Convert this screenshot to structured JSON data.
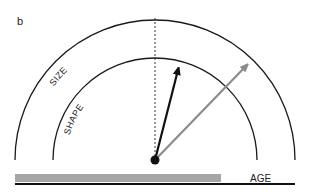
{
  "panel_label": "b",
  "arcs": {
    "outer_label": "SIZE",
    "inner_label": "SHAPE"
  },
  "axis": {
    "label": "AGE"
  },
  "arrows": [
    {
      "name": "black-arrow",
      "color": "#111111"
    },
    {
      "name": "gray-arrow",
      "color": "#8c8c8c"
    }
  ],
  "colors": {
    "arc": "#1a1a1a",
    "bar": "#a6a6a6",
    "baseline": "#111111",
    "dashed_line": "#333333"
  }
}
